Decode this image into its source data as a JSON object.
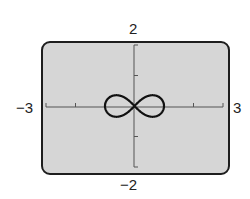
{
  "chart_data": {
    "type": "line",
    "title": "",
    "subtitle": "",
    "xlabel": "",
    "ylabel": "",
    "xlim": [
      -3,
      3
    ],
    "ylim": [
      -2,
      2
    ],
    "grid": false,
    "legend": null,
    "tick_labels": {
      "x_min": "−3",
      "x_max": "3",
      "y_max": "2",
      "y_min": "−2"
    },
    "x_ticks": [
      -3,
      -2,
      -1,
      0,
      1,
      2,
      3
    ],
    "y_ticks": [
      -2,
      -1,
      0,
      1,
      2
    ],
    "series": [
      {
        "name": "lemniscate",
        "description": "Figure-eight curve (lemniscate of Bernoulli, r^2 = cos 2θ)",
        "equation": "r^2 = cos(2θ)",
        "x_extent": [
          -1,
          1
        ],
        "y_extent": [
          -0.35,
          0.35
        ],
        "color": "#111111"
      }
    ],
    "colors": {
      "screen_background": "#d6d6d6",
      "frame_border": "#1e1e1e",
      "axis": "#555555"
    }
  }
}
